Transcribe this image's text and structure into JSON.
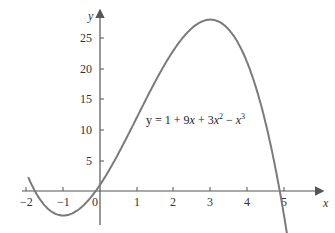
{
  "chart_data": {
    "type": "line",
    "title": "",
    "xlabel": "x",
    "ylabel": "y",
    "xlim": [
      -2.05,
      5.15
    ],
    "ylim": [
      -5.5,
      29
    ],
    "grid": false,
    "x_ticks": [
      -2,
      -1,
      0,
      1,
      2,
      3,
      4,
      5
    ],
    "x_tick_labels": [
      "−2",
      "−1",
      "0",
      "1",
      "2",
      "3",
      "4",
      "5"
    ],
    "y_ticks": [
      5,
      10,
      15,
      20,
      25
    ],
    "y_tick_labels": [
      "5",
      "10",
      "15",
      "20",
      "25"
    ],
    "series": [
      {
        "name": "y = 1 + 9x + 3x^2 − x^3",
        "function": "1 + 9x + 3x^2 - x^3",
        "x": [
          -1.95,
          -1.5,
          -1,
          -0.5,
          0,
          0.5,
          1,
          1.5,
          2,
          2.5,
          3,
          3.5,
          4,
          4.5,
          5,
          5.15
        ],
        "values": [
          3.0,
          -2.6,
          -4,
          -1.6,
          1,
          6.1,
          12,
          18.6,
          23,
          26.6,
          28,
          26.4,
          21,
          11.9,
          -4,
          -9.2
        ]
      }
    ],
    "annotations": [
      {
        "text": "y = 1 + 9x + 3x² − x³",
        "x": 1.3,
        "y": 12
      }
    ],
    "key_points": {
      "local_min": [
        -1,
        -4
      ],
      "local_max": [
        3,
        28
      ],
      "y_intercept": [
        0,
        1
      ]
    }
  },
  "axes": {
    "x_label": "x",
    "y_label": "y",
    "x_ticks": [
      {
        "value": -2,
        "label": "−2"
      },
      {
        "value": -1,
        "label": "−1"
      },
      {
        "value": 0,
        "label": "0"
      },
      {
        "value": 1,
        "label": "1"
      },
      {
        "value": 2,
        "label": "2"
      },
      {
        "value": 3,
        "label": "3"
      },
      {
        "value": 4,
        "label": "4"
      },
      {
        "value": 5,
        "label": "5"
      }
    ],
    "y_ticks": [
      {
        "value": 5,
        "label": "5"
      },
      {
        "value": 10,
        "label": "10"
      },
      {
        "value": 15,
        "label": "15"
      },
      {
        "value": 20,
        "label": "20"
      },
      {
        "value": 25,
        "label": "25"
      }
    ]
  },
  "equation": {
    "prefix": "y = 1 + 9",
    "x1": "x",
    "mid": " + 3",
    "x2": "x",
    "exp2": "2",
    "minus": " − ",
    "x3": "x",
    "exp3": "3"
  },
  "colors": {
    "curve": "#7a7a7a",
    "axis": "#555555",
    "text": "#333333",
    "background": "#ffffff"
  }
}
